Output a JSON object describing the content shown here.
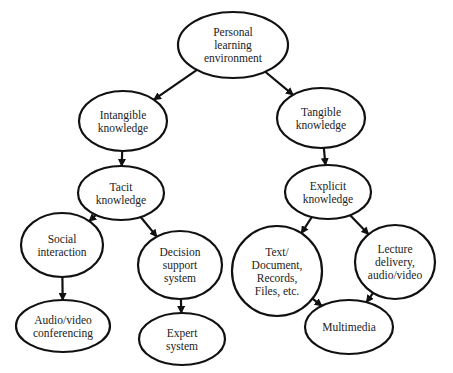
{
  "diagram": {
    "type": "tree",
    "nodes": [
      {
        "id": "ple",
        "lines": [
          "Personal",
          "learning",
          "environment"
        ]
      },
      {
        "id": "intangible",
        "lines": [
          "Intangible",
          "knowledge"
        ]
      },
      {
        "id": "tangible",
        "lines": [
          "Tangible",
          "knowledge"
        ]
      },
      {
        "id": "tacit",
        "lines": [
          "Tacit",
          "knowledge"
        ]
      },
      {
        "id": "explicit",
        "lines": [
          "Explicit",
          "knowledge"
        ]
      },
      {
        "id": "social",
        "lines": [
          "Social",
          "interaction"
        ]
      },
      {
        "id": "dss",
        "lines": [
          "Decision",
          "support",
          "system"
        ]
      },
      {
        "id": "avconf",
        "lines": [
          "Audio/video",
          "conferencing"
        ]
      },
      {
        "id": "expert",
        "lines": [
          "Expert",
          "system"
        ]
      },
      {
        "id": "text",
        "lines": [
          "Text/",
          "Document,",
          "Records,",
          "Files, etc."
        ]
      },
      {
        "id": "lecture",
        "lines": [
          "Lecture",
          "delivery,",
          "audio/video"
        ]
      },
      {
        "id": "multimedia",
        "lines": [
          "Multimedia"
        ]
      }
    ],
    "edges": [
      {
        "from": "ple",
        "to": "intangible"
      },
      {
        "from": "ple",
        "to": "tangible"
      },
      {
        "from": "intangible",
        "to": "tacit"
      },
      {
        "from": "tangible",
        "to": "explicit"
      },
      {
        "from": "tacit",
        "to": "social"
      },
      {
        "from": "tacit",
        "to": "dss"
      },
      {
        "from": "social",
        "to": "avconf"
      },
      {
        "from": "dss",
        "to": "expert"
      },
      {
        "from": "explicit",
        "to": "text"
      },
      {
        "from": "explicit",
        "to": "lecture"
      },
      {
        "from": "text",
        "to": "multimedia"
      },
      {
        "from": "lecture",
        "to": "multimedia"
      }
    ]
  }
}
